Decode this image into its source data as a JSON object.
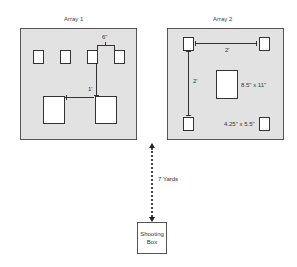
{
  "array1": {
    "title": "Array 1",
    "spacing_small_label": "6\"",
    "spacing_large_label": "1'",
    "small_targets": 4,
    "large_targets": 2
  },
  "array2": {
    "title": "Array 2",
    "horizontal_spacing_label": "2'",
    "vertical_spacing_label": "2'",
    "center_target_label": "8.5\" x 11\"",
    "corner_target_label": "4.25\" x 5.5\""
  },
  "distance": {
    "label": "7 Yards"
  },
  "shooting_box": {
    "line1": "Shooting",
    "line2": "Box"
  },
  "colors": {
    "frame_fill": "#e2e2e2",
    "frame_border": "#555555",
    "target_fill": "#ffffff",
    "line": "#333333"
  }
}
